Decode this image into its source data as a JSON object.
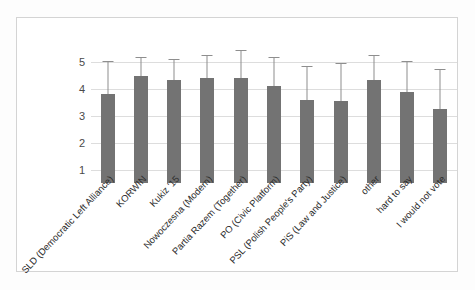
{
  "chart_data": {
    "type": "bar",
    "title": "",
    "subtitle": "",
    "xlabel": "",
    "ylabel": "",
    "ylim": [
      1,
      5
    ],
    "yticks": [
      1,
      2,
      3,
      4,
      5
    ],
    "grid": true,
    "legend": false,
    "error_bars": "upper whisker with cap",
    "bar_color": "#737373",
    "error_bar_color": "#8e8e8e",
    "frame_color": "#d4d4d4",
    "gridline_color": "#dddddd",
    "categories": [
      "SLD (Democratic Left Alliance)",
      "KORWIN",
      "Kukiz '15",
      "Nowoczesna (Modern)",
      "Partia Razem (Together)",
      "PO (Civic Platform)",
      "PSL (Polish People's Party)",
      "PiS (Law and Justice)",
      "other",
      "hard to say",
      "I would not vote"
    ],
    "values": [
      3.8,
      4.5,
      4.35,
      4.4,
      4.4,
      4.1,
      3.6,
      3.55,
      4.35,
      3.9,
      3.25
    ],
    "error_upper": [
      5.05,
      5.2,
      5.1,
      5.25,
      5.45,
      5.2,
      4.85,
      4.95,
      5.25,
      5.05,
      4.75
    ]
  }
}
